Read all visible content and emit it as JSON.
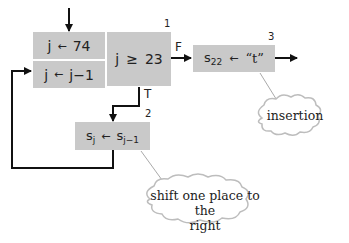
{
  "nodes": {
    "init": {
      "var": "j",
      "arrow": "←",
      "value": "74"
    },
    "decrement": {
      "var": "j",
      "arrow": "←",
      "value": "j−1"
    },
    "test": {
      "number": "1",
      "var": "j",
      "op": "≥",
      "value": "23"
    },
    "shift": {
      "number": "2",
      "lhs": "s",
      "lhs_sub": "j",
      "arrow": "←",
      "rhs": "s",
      "rhs_sub": "j−1"
    },
    "insert": {
      "number": "3",
      "lhs": "s",
      "lhs_sub": "22",
      "arrow": "←",
      "rhs": "“t”"
    }
  },
  "edges": {
    "false_label": "F",
    "true_label": "T"
  },
  "annotations": {
    "insertion": "insertion",
    "shift_line1": "shift one place to the",
    "shift_line2": "right"
  }
}
